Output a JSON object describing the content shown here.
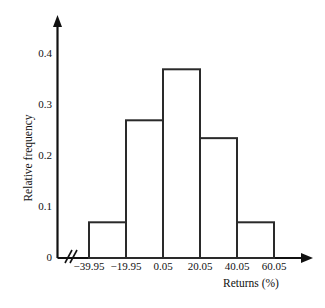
{
  "chart_data": {
    "type": "bar",
    "title": "",
    "xlabel": "Returns (%)",
    "ylabel": "Relative frequency",
    "categories": [
      "-39.95 to -19.95",
      "-19.95 to 0.05",
      "0.05 to 20.05",
      "20.05 to 40.05",
      "40.05 to 60.05"
    ],
    "values": [
      0.07,
      0.27,
      0.37,
      0.235,
      0.07
    ],
    "bin_edges": [
      -39.95,
      -19.95,
      0.05,
      20.05,
      40.05,
      60.05
    ],
    "x_tick_labels": [
      "−39.95",
      "−19.95",
      "0.05",
      "20.05",
      "40.05",
      "60.05"
    ],
    "y_tick_labels": [
      "0",
      "0.1",
      "0.2",
      "0.3",
      "0.4"
    ],
    "y_tick_values": [
      0,
      0.1,
      0.2,
      0.3,
      0.4
    ],
    "ylim": [
      0,
      0.45
    ],
    "xlim": [
      -39.95,
      60.05
    ],
    "grid": false,
    "legend": null,
    "axis_break": true,
    "bar_fill": "#ffffff",
    "bar_stroke": "#2a2a2a",
    "axis_color": "#111111"
  },
  "axes": {
    "x_title": "Returns (%)",
    "y_title": "Relative frequency"
  }
}
